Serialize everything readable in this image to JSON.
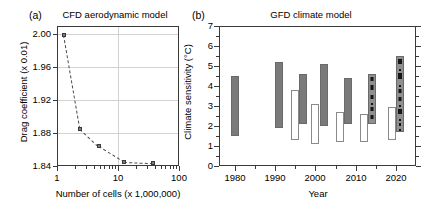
{
  "figure": {
    "background": "#ffffff",
    "width": 435,
    "height": 219
  },
  "panel_a": {
    "letter": "(a)",
    "title": "CFD aerodynamic model"
  },
  "panel_b": {
    "letter": "(b)",
    "title": "GFD climate model"
  },
  "chart_data": [
    {
      "type": "line",
      "panel": "(a)",
      "title": "CFD aerodynamic model",
      "xlabel": "Number of cells (x 1,000,000)",
      "ylabel": "Drag coefficient (x 0.01)",
      "xscale": "log",
      "xlim": [
        1,
        100
      ],
      "ylim": [
        1.84,
        2.01
      ],
      "xticks": [
        1,
        10,
        100
      ],
      "xticklabels": [
        "1",
        "10",
        "100"
      ],
      "yticks": [
        1.84,
        1.88,
        1.92,
        1.96,
        2.0
      ],
      "yticklabels": [
        "1.84",
        "1.88",
        "1.92",
        "1.96",
        "2.00"
      ],
      "grid": "horizontal-and-vertical-major",
      "legend": "none",
      "linestyle": "dashed",
      "marker": "square-open",
      "series": [
        {
          "name": "Drag coefficient vs mesh size",
          "x": [
            1.3,
            2.4,
            4.8,
            12.5,
            38.0
          ],
          "y": [
            1.999,
            1.885,
            1.864,
            1.845,
            1.8435
          ]
        }
      ]
    },
    {
      "type": "bar",
      "bar_style": "floating-range-bars",
      "panel": "(b)",
      "title": "GFD climate model",
      "xlabel": "Year",
      "ylabel": "Climate sensitivity (°C)",
      "xlim": [
        1976,
        2025
      ],
      "ylim": [
        0,
        7
      ],
      "xticks": [
        1980,
        1990,
        2000,
        2010,
        2020
      ],
      "xticklabels": [
        "1980",
        "1990",
        "2000",
        "2010",
        "2020"
      ],
      "yticks": [
        0,
        1,
        2,
        3,
        4,
        5,
        6,
        7
      ],
      "yticklabels": [
        "0",
        "1",
        "2",
        "3",
        "4",
        "5",
        "6",
        "7"
      ],
      "grid": "off",
      "legend": "none",
      "bars": [
        {
          "year": 1980,
          "low": 1.5,
          "high": 4.5,
          "style": "filled"
        },
        {
          "year": 1991,
          "low": 1.9,
          "high": 5.2,
          "style": "filled"
        },
        {
          "year": 1995,
          "low": 1.3,
          "high": 3.8,
          "style": "open"
        },
        {
          "year": 1997,
          "low": 2.1,
          "high": 4.6,
          "style": "filled"
        },
        {
          "year": 2000,
          "low": 1.1,
          "high": 3.1,
          "style": "open"
        },
        {
          "year": 2002,
          "low": 2.0,
          "high": 5.1,
          "style": "filled"
        },
        {
          "year": 2006,
          "low": 1.2,
          "high": 2.7,
          "style": "open"
        },
        {
          "year": 2008,
          "low": 2.1,
          "high": 4.4,
          "style": "filled"
        },
        {
          "year": 2012,
          "low": 1.2,
          "high": 2.6,
          "style": "open"
        },
        {
          "year": 2014,
          "low": 2.1,
          "high": 4.6,
          "style": "dotted"
        },
        {
          "year": 2019,
          "low": 1.3,
          "high": 2.95,
          "style": "open"
        },
        {
          "year": 2021,
          "low": 1.7,
          "high": 5.5,
          "style": "dotted"
        }
      ]
    }
  ]
}
